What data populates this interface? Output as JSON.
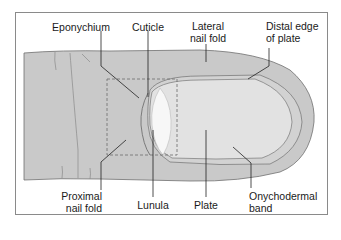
{
  "diagram": {
    "colors": {
      "skin": "#c9c9c9",
      "nail_plate": "#e2e2e2",
      "lunula": "#f6f6f6",
      "outline": "#6e6e6e",
      "leader": "#222222",
      "dashed_box": "#777777",
      "frame": "#8a8a8a"
    },
    "labels": {
      "eponychium": "Eponychium",
      "cuticle": "Cuticle",
      "lateral_nail_fold_1": "Lateral",
      "lateral_nail_fold_2": "nail fold",
      "distal_edge_1": "Distal edge",
      "distal_edge_2": "of plate",
      "proximal_nail_fold_1": "Proximal",
      "proximal_nail_fold_2": "nail fold",
      "lunula": "Lunula",
      "plate": "Plate",
      "onychodermal_1": "Onychodermal",
      "onychodermal_2": "band"
    }
  }
}
